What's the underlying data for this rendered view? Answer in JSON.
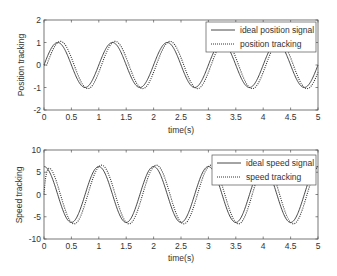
{
  "chart_data": [
    {
      "type": "line",
      "title": "",
      "xlabel": "time(s)",
      "ylabel": "Position tracking",
      "xlim": [
        0,
        5
      ],
      "ylim": [
        -2,
        2
      ],
      "xticks": [
        0,
        0.5,
        1,
        1.5,
        2,
        2.5,
        3,
        3.5,
        4,
        4.5,
        5
      ],
      "xtick_labels": [
        "0",
        "0.5",
        "1",
        "1.5",
        "2",
        "2.5",
        "3",
        "3.5",
        "4",
        "4.5",
        "5"
      ],
      "yticks": [
        -2,
        -1,
        0,
        1,
        2
      ],
      "ytick_labels": [
        "-2",
        "-1",
        "0",
        "1",
        "2"
      ],
      "grid": false,
      "legend_position": "upper right",
      "series": [
        {
          "name": "ideal position signal",
          "style": "solid",
          "formula": "sin(2*pi*t)",
          "amplitude": 1,
          "frequency_hz": 1,
          "phase_lag_s": 0,
          "x": [
            0,
            0.25,
            0.5,
            0.75,
            1,
            1.25,
            1.5,
            1.75,
            2,
            2.25,
            2.5,
            2.75,
            3,
            3.25,
            3.5,
            3.75,
            4,
            4.25,
            4.5,
            4.75,
            5
          ],
          "values": [
            0,
            1,
            0,
            -1,
            0,
            1,
            0,
            -1,
            0,
            1,
            0,
            -1,
            0,
            1,
            0,
            -1,
            0,
            1,
            0,
            -1,
            0
          ]
        },
        {
          "name": "position tracking",
          "style": "dotted",
          "formula": "sin(2*pi*(t-0.05))",
          "amplitude": 1.05,
          "frequency_hz": 1,
          "phase_lag_s": 0.05,
          "x": [
            0,
            0.3,
            0.55,
            0.8,
            1.05,
            1.3,
            1.55,
            1.8,
            2.05,
            2.3,
            2.55,
            2.8,
            3.05,
            3.3,
            3.55,
            3.8,
            4.05,
            4.3,
            4.55,
            4.8,
            5
          ],
          "values": [
            0,
            1.05,
            0,
            -1.05,
            0,
            1.05,
            0,
            -1.05,
            0,
            1.05,
            0,
            -1.05,
            0,
            1.05,
            0,
            -1.05,
            0,
            1.05,
            0,
            -1.05,
            -0.3
          ]
        }
      ]
    },
    {
      "type": "line",
      "title": "",
      "xlabel": "time(s)",
      "ylabel": "Speed tracking",
      "xlim": [
        0,
        5
      ],
      "ylim": [
        -10,
        10
      ],
      "xticks": [
        0,
        0.5,
        1,
        1.5,
        2,
        2.5,
        3,
        3.5,
        4,
        4.5,
        5
      ],
      "xtick_labels": [
        "0",
        "0.5",
        "1",
        "1.5",
        "2",
        "2.5",
        "3",
        "3.5",
        "4",
        "4.5",
        "5"
      ],
      "yticks": [
        -10,
        -5,
        0,
        5,
        10
      ],
      "ytick_labels": [
        "-10",
        "-5",
        "0",
        "5",
        "10"
      ],
      "grid": false,
      "legend_position": "upper right",
      "series": [
        {
          "name": "ideal speed signal",
          "style": "solid",
          "formula": "2*pi*cos(2*pi*t)",
          "amplitude": 6.28,
          "frequency_hz": 1,
          "phase_lag_s": 0,
          "x": [
            0,
            0.25,
            0.5,
            0.75,
            1,
            1.25,
            1.5,
            1.75,
            2,
            2.25,
            2.5,
            2.75,
            3,
            3.25,
            3.5,
            3.75,
            4,
            4.25,
            4.5,
            4.75,
            5
          ],
          "values": [
            6.28,
            0,
            -6.28,
            0,
            6.28,
            0,
            -6.28,
            0,
            6.28,
            0,
            -6.28,
            0,
            6.28,
            0,
            -6.28,
            0,
            6.28,
            0,
            -6.28,
            0,
            6.28
          ]
        },
        {
          "name": "speed tracking",
          "style": "dotted",
          "formula": "starts at 0, rises to ~5.5 at t=0.1, then lags ideal by ~0.05s",
          "amplitude": 6.6,
          "frequency_hz": 1,
          "phase_lag_s": 0.05,
          "x": [
            0,
            0.1,
            0.3,
            0.55,
            0.8,
            1.05,
            1.3,
            1.55,
            1.8,
            2.05,
            2.3,
            2.55,
            2.8,
            3.05,
            3.3,
            3.55,
            3.8,
            4.05,
            4.3,
            4.55,
            4.8,
            5
          ],
          "values": [
            0,
            5.5,
            0,
            -6.6,
            0,
            6.6,
            0,
            -6.6,
            0,
            6.6,
            0,
            -6.6,
            0,
            6.6,
            0,
            -6.6,
            0,
            6.6,
            0,
            -6.6,
            0,
            6.0
          ]
        }
      ]
    }
  ],
  "plots": [
    {
      "ylabel": "Position tracking",
      "xlabel": "time(s)",
      "legend": [
        "ideal position signal",
        "position tracking"
      ]
    },
    {
      "ylabel": "Speed tracking",
      "xlabel": "time(s)",
      "legend": [
        "ideal speed signal",
        "speed tracking"
      ]
    }
  ],
  "colors": {
    "line": "#333333",
    "axis": "#555555",
    "background": "#ffffff"
  }
}
